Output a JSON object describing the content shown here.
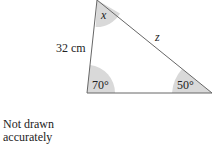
{
  "diagram": {
    "type": "triangle",
    "side_label": "32 cm",
    "unknown_side_label": "z",
    "angles": {
      "top": "x",
      "bottom_left": "70°",
      "bottom_right": "50°"
    },
    "shading_color": "#d9d9d9",
    "line_color": "#666666"
  },
  "note": {
    "line1": "Not drawn",
    "line2": "accurately"
  }
}
